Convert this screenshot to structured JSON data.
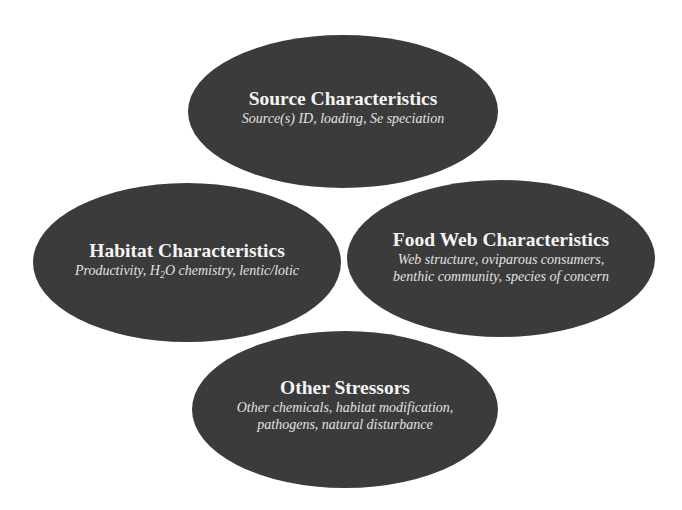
{
  "colors": {
    "ellipse_fill": "#3b3b3b",
    "text": "#ffffff",
    "background": "#ffffff"
  },
  "nodes": [
    {
      "id": "source",
      "title": "Source Characteristics",
      "description_lines": [
        "Source(s) ID, loading, Se speciation"
      ]
    },
    {
      "id": "habitat",
      "title": "Habitat Characteristics",
      "description_parts": {
        "before": "Productivity, H",
        "sub": "2",
        "after": "O chemistry, lentic/lotic"
      }
    },
    {
      "id": "foodweb",
      "title": "Food Web Characteristics",
      "description_lines": [
        "Web structure, oviparous consumers,",
        "benthic community, species of concern"
      ]
    },
    {
      "id": "other",
      "title": "Other Stressors",
      "description_lines": [
        "Other chemicals, habitat modification,",
        "pathogens, natural disturbance"
      ]
    }
  ]
}
